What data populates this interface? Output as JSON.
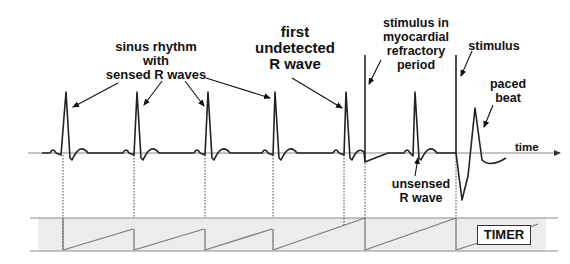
{
  "annotations": {
    "sinus_rhythm": "sinus rhythm\nwith\nsensed R waves",
    "first_undetected": "first\nundetected\nR wave",
    "stimulus_refractory": "stimulus in\nmyocardial\nrefractory\nperiod",
    "stimulus": "stimulus",
    "paced_beat": "paced\nbeat",
    "unsensed": "unsensed\nR wave",
    "time_axis": "time",
    "timer": "TIMER"
  },
  "colors": {
    "trace": "#222222",
    "baseline": "#8a8a8a",
    "timer_band": "#ececec",
    "timer_ramp": "#7a7a7a",
    "text": "#111111"
  },
  "events": {
    "sensed_r_waves_x": [
      66,
      137,
      208,
      275
    ],
    "first_undetected_r_x": 346,
    "refractory_stimulus_x": 365,
    "unsensed_r_x": 415,
    "stimulus_x": 456
  }
}
